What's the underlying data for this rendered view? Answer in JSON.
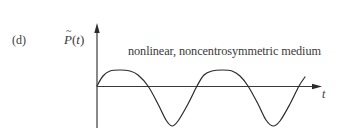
{
  "figure": {
    "panel_label": "(d)",
    "y_axis_label": {
      "symbol": "P",
      "accent": "~",
      "argument_open": "(",
      "argument": "t",
      "argument_close": ")"
    },
    "x_axis_label": "t",
    "caption": "nonlinear, noncentrosymmetric medium",
    "colors": {
      "line": "#2b2b2b",
      "axis": "#3a3a3a",
      "text": "#3a3a3a",
      "background": "#ffffff"
    }
  },
  "chart_data": {
    "type": "line",
    "title": "nonlinear, noncentrosymmetric medium",
    "panel": "(d)",
    "xlabel": "t",
    "ylabel": "P̃(t)",
    "grid": false,
    "legend": null,
    "axes_pixels": {
      "origin": [
        97,
        86
      ],
      "y_axis": {
        "top": 24,
        "bottom": 128
      },
      "x_axis": {
        "left": 97,
        "right": 321
      }
    },
    "series": [
      {
        "name": "P(t)",
        "points_px": [
          [
            97,
            86
          ],
          [
            103,
            76
          ],
          [
            110,
            71
          ],
          [
            120,
            70
          ],
          [
            130,
            71
          ],
          [
            138,
            75
          ],
          [
            148,
            86
          ],
          [
            158,
            104
          ],
          [
            166,
            120
          ],
          [
            172,
            126
          ],
          [
            178,
            121
          ],
          [
            188,
            104
          ],
          [
            197,
            86
          ],
          [
            204,
            75
          ],
          [
            212,
            71
          ],
          [
            222,
            70
          ],
          [
            232,
            71
          ],
          [
            240,
            76
          ],
          [
            248,
            86
          ],
          [
            258,
            104
          ],
          [
            266,
            120
          ],
          [
            273,
            126
          ],
          [
            280,
            121
          ],
          [
            290,
            104
          ],
          [
            299,
            86
          ],
          [
            305,
            77
          ]
        ],
        "relative_extrema": {
          "positive_peak_amplitude": 16,
          "negative_trough_amplitude": 40
        }
      }
    ]
  }
}
